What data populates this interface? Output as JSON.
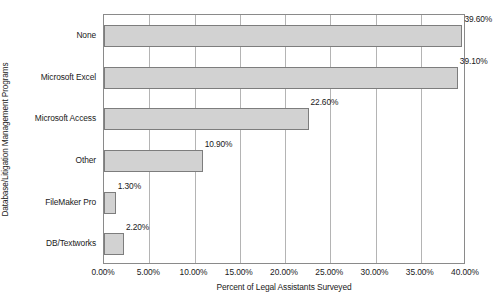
{
  "chart_data": {
    "type": "bar",
    "orientation": "horizontal",
    "title": "",
    "xlabel": "Percent of Legal Assistants Surveyed",
    "ylabel": "Database/Litigation Management Programs",
    "categories": [
      "None",
      "Microsoft Excel",
      "Microsoft Access",
      "Other",
      "FileMaker Pro",
      "DB/Textworks"
    ],
    "values": [
      39.6,
      39.1,
      22.6,
      10.9,
      1.3,
      2.2
    ],
    "value_labels": [
      "39.60%",
      "39.10%",
      "22.60%",
      "10.90%",
      "1.30%",
      "2.20%"
    ],
    "xlim": [
      0,
      40
    ],
    "xticks": [
      0,
      5,
      10,
      15,
      20,
      25,
      30,
      35,
      40
    ],
    "xtick_labels": [
      "0.00%",
      "5.00%",
      "10.00%",
      "15.00%",
      "20.00%",
      "25.00%",
      "30.00%",
      "35.00%",
      "40.00%"
    ],
    "grid": "vertical",
    "legend": "none",
    "bar_fill_color": "#d2d2d2",
    "bar_border_color": "#7d7d7d",
    "gridline_color": "#b4b4b4",
    "axis_color": "#8a8a8a"
  }
}
